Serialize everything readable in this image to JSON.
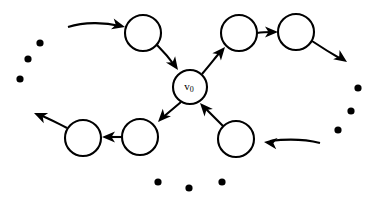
{
  "figure": {
    "type": "directed-graph-diagram",
    "title": "",
    "background_color": "#ffffff",
    "stroke_color": "#000000",
    "width": 380,
    "height": 197
  },
  "nodes": [
    {
      "id": "v0",
      "label_base": "v",
      "label_sub": "0",
      "cx": 190,
      "cy": 87,
      "r": 17,
      "name": "center-node-v0"
    },
    {
      "id": "top_left",
      "label_base": "",
      "label_sub": "",
      "cx": 143,
      "cy": 33,
      "r": 18,
      "name": "node-top-left"
    },
    {
      "id": "top_mid",
      "label_base": "",
      "label_sub": "",
      "cx": 239,
      "cy": 33,
      "r": 18,
      "name": "node-top-middle"
    },
    {
      "id": "top_right",
      "label_base": "",
      "label_sub": "",
      "cx": 296,
      "cy": 32,
      "r": 18,
      "name": "node-top-right"
    },
    {
      "id": "bot_left",
      "label_base": "",
      "label_sub": "",
      "cx": 83,
      "cy": 138,
      "r": 18,
      "name": "node-bottom-left"
    },
    {
      "id": "bot_mid",
      "label_base": "",
      "label_sub": "",
      "cx": 140,
      "cy": 137,
      "r": 18,
      "name": "node-bottom-middle"
    },
    {
      "id": "bot_right",
      "label_base": "",
      "label_sub": "",
      "cx": 236,
      "cy": 139,
      "r": 18,
      "name": "node-bottom-right"
    }
  ],
  "edges": [
    {
      "id": "e_in_topleft",
      "from": "incoming-left",
      "to": "top_left",
      "name": "edge-incoming-into-top-left",
      "d": "M 68 27 C 84 22, 104 22, 120 26",
      "head": {
        "x": 125,
        "y": 27,
        "angle": 14
      }
    },
    {
      "id": "e_topleft_v0",
      "from": "top_left",
      "to": "v0",
      "name": "edge-top-left-to-v0",
      "d": "M 157 45 C 165 53, 170 59, 175 66",
      "head": {
        "x": 178,
        "y": 70,
        "angle": 55
      }
    },
    {
      "id": "e_v0_topmid",
      "from": "v0",
      "to": "top_mid",
      "name": "edge-v0-to-top-middle",
      "d": "M 202 74 C 209 66, 215 58, 221 51",
      "head": {
        "x": 225,
        "y": 47,
        "angle": -50
      }
    },
    {
      "id": "e_topmid_topright",
      "from": "top_mid",
      "to": "top_right",
      "name": "edge-top-middle-to-top-right",
      "d": "M 257 33 C 263 32, 268 32, 273 32",
      "head": {
        "x": 278,
        "y": 32,
        "angle": 0
      }
    },
    {
      "id": "e_topright_out",
      "from": "top_right",
      "to": "outgoing-right",
      "name": "edge-top-right-outgoing",
      "d": "M 312 41 C 324 49, 334 55, 341 59",
      "head": {
        "x": 347,
        "y": 62,
        "angle": 35
      }
    },
    {
      "id": "e_v0_botmid",
      "from": "v0",
      "to": "bot_mid",
      "name": "edge-v0-to-bottom-middle",
      "d": "M 181 102 C 174 108, 168 113, 162 118",
      "head": {
        "x": 158,
        "y": 122,
        "angle": 133
      }
    },
    {
      "id": "e_botmid_botleft",
      "from": "bot_mid",
      "to": "bot_left",
      "name": "edge-bottom-middle-to-bottom-left",
      "d": "M 122 137 C 117 137, 112 137, 107 137",
      "head": {
        "x": 102,
        "y": 137,
        "angle": 180
      }
    },
    {
      "id": "e_botleft_out",
      "from": "bot_left",
      "to": "outgoing-left",
      "name": "edge-bottom-left-outgoing",
      "d": "M 67 128 C 57 123, 48 118, 40 115",
      "head": {
        "x": 34,
        "y": 113,
        "angle": -157
      }
    },
    {
      "id": "e_botright_v0",
      "from": "bot_right",
      "to": "v0",
      "name": "edge-bottom-right-to-v0",
      "d": "M 223 126 C 216 119, 210 113, 204 107",
      "head": {
        "x": 200,
        "y": 103,
        "angle": -132
      }
    },
    {
      "id": "e_in_botright",
      "from": "incoming-right",
      "to": "bot_right",
      "name": "edge-incoming-into-bottom-right",
      "d": "M 320 143 C 304 139, 286 139, 270 141",
      "head": {
        "x": 264,
        "y": 142,
        "angle": 187
      }
    }
  ],
  "ellipses": [
    {
      "group": "left",
      "name": "ellipsis-dots-left",
      "dots": [
        {
          "cx": 40,
          "cy": 43,
          "r": 3.6
        },
        {
          "cx": 28,
          "cy": 59,
          "r": 3.6
        },
        {
          "cx": 20,
          "cy": 79,
          "r": 3.6
        }
      ]
    },
    {
      "group": "right",
      "name": "ellipsis-dots-right",
      "dots": [
        {
          "cx": 358,
          "cy": 88,
          "r": 3.6
        },
        {
          "cx": 351,
          "cy": 111,
          "r": 3.6
        },
        {
          "cx": 338,
          "cy": 130,
          "r": 3.6
        }
      ]
    },
    {
      "group": "bottom",
      "name": "ellipsis-dots-bottom",
      "dots": [
        {
          "cx": 158,
          "cy": 182,
          "r": 3.6
        },
        {
          "cx": 189,
          "cy": 188,
          "r": 3.6
        },
        {
          "cx": 222,
          "cy": 182,
          "r": 3.6
        }
      ]
    }
  ]
}
